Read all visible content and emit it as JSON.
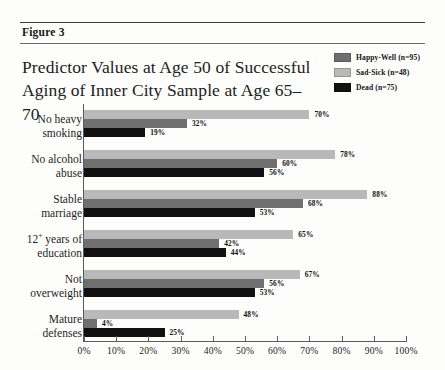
{
  "figure": {
    "label": "Figure 3",
    "title_line1": "Predictor Values at Age 50 of Successful",
    "title_line2": "Aging of Inner City Sample at Age 65–70"
  },
  "legend": {
    "items": [
      {
        "label": "Happy-Well (n=95)",
        "color": "#6f6f6f",
        "key": "happy"
      },
      {
        "label": "Sad-Sick (n=48)",
        "color": "#b9b9b9",
        "key": "sad"
      },
      {
        "label": "Dead (n=75)",
        "color": "#111111",
        "key": "dead"
      }
    ]
  },
  "axis": {
    "ticks": [
      "0%",
      "10%",
      "20%",
      "30%",
      "40%",
      "50%",
      "60%",
      "70%",
      "80%",
      "90%",
      "100%"
    ]
  },
  "chart_data": {
    "type": "bar",
    "orientation": "horizontal",
    "title": "Predictor Values at Age 50 of Successful Aging of Inner City Sample at Age 65–70",
    "xlabel": "",
    "ylabel": "",
    "xlim": [
      0,
      100
    ],
    "grid": false,
    "legend_position": "top-right",
    "categories": [
      "No heavy smoking",
      "No alcohol abuse",
      "Stable marriage",
      "12⁺ years of education",
      "Not overweight",
      "Mature defenses"
    ],
    "series": [
      {
        "name": "Sad-Sick (n=48)",
        "key": "sad",
        "color": "#b9b9b9",
        "values": [
          70,
          78,
          88,
          65,
          67,
          48
        ]
      },
      {
        "name": "Happy-Well (n=95)",
        "key": "happy",
        "color": "#6f6f6f",
        "values": [
          32,
          60,
          68,
          42,
          56,
          4
        ]
      },
      {
        "name": "Dead (n=75)",
        "key": "dead",
        "color": "#111111",
        "values": [
          19,
          56,
          53,
          44,
          53,
          25
        ]
      }
    ],
    "value_labels": [
      [
        "70%",
        "32%",
        "19%"
      ],
      [
        "78%",
        "60%",
        "56%"
      ],
      [
        "88%",
        "68%",
        "53%"
      ],
      [
        "65%",
        "42%",
        "44%"
      ],
      [
        "67%",
        "56%",
        "53%"
      ],
      [
        "48%",
        "4%",
        "25%"
      ]
    ],
    "category_label_lines": [
      [
        "No heavy",
        "smoking"
      ],
      [
        "No alcohol",
        "abuse"
      ],
      [
        "Stable",
        "marriage"
      ],
      [
        "12+ years of",
        "education"
      ],
      [
        "Not",
        "overweight"
      ],
      [
        "Mature",
        "defenses"
      ]
    ]
  }
}
